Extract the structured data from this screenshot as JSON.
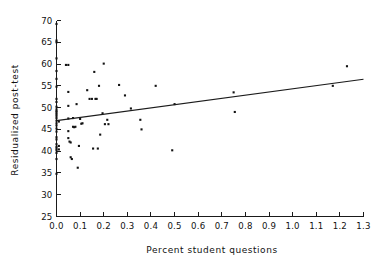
{
  "chart_data": {
    "type": "scatter",
    "title": "",
    "xlabel": "Percent student questions",
    "ylabel": "Residualized post-test",
    "xlim": [
      0.0,
      1.3
    ],
    "ylim": [
      25,
      70
    ],
    "grid": false,
    "legend": false,
    "xticks": [
      "0.0",
      "0.1",
      "0.2",
      "0.3",
      "0.4",
      "0.5",
      "0.6",
      "0.7",
      "0.8",
      "0.9",
      "1.0",
      "1.1",
      "1.2",
      "1.3"
    ],
    "xtick_values": [
      0.0,
      0.1,
      0.2,
      0.3,
      0.4,
      0.5,
      0.6,
      0.7,
      0.8,
      0.9,
      1.0,
      1.1,
      1.2,
      1.3
    ],
    "yticks": [
      "25",
      "30",
      "35",
      "40",
      "45",
      "50",
      "55",
      "60",
      "65",
      "70"
    ],
    "ytick_values": [
      25,
      30,
      35,
      40,
      45,
      50,
      55,
      60,
      65,
      70
    ],
    "marker": "square",
    "marker_color": "#131313",
    "marker_size": 2.1,
    "points": [
      [
        0.0,
        69.2
      ],
      [
        0.0,
        65.4
      ],
      [
        0.0,
        65.0
      ],
      [
        0.0,
        61.3
      ],
      [
        0.0,
        58.4
      ],
      [
        0.0,
        56.6
      ],
      [
        0.0,
        54.8
      ],
      [
        0.0,
        52.0
      ],
      [
        0.0,
        51.3
      ],
      [
        0.0,
        50.2
      ],
      [
        0.0,
        49.6
      ],
      [
        0.0,
        49.2
      ],
      [
        0.0,
        48.9
      ],
      [
        0.0,
        48.5
      ],
      [
        0.0,
        48.1
      ],
      [
        0.0,
        47.6
      ],
      [
        0.0,
        47.0
      ],
      [
        0.0,
        46.4
      ],
      [
        0.0,
        45.9
      ],
      [
        0.0,
        45.2
      ],
      [
        0.0,
        44.5
      ],
      [
        0.0,
        43.2
      ],
      [
        0.0,
        42.7
      ],
      [
        0.0,
        41.6
      ],
      [
        0.0,
        41.0
      ],
      [
        0.0,
        40.6
      ],
      [
        0.0,
        40.2
      ],
      [
        0.0,
        39.6
      ],
      [
        0.0,
        38.2
      ],
      [
        0.0,
        34.8
      ],
      [
        0.01,
        46.8
      ],
      [
        0.01,
        41.2
      ],
      [
        0.01,
        40.4
      ],
      [
        0.04,
        59.8
      ],
      [
        0.05,
        59.8
      ],
      [
        0.05,
        53.6
      ],
      [
        0.05,
        50.4
      ],
      [
        0.05,
        47.5
      ],
      [
        0.05,
        44.6
      ],
      [
        0.05,
        43.0
      ],
      [
        0.055,
        42.2
      ],
      [
        0.06,
        42.0
      ],
      [
        0.06,
        38.6
      ],
      [
        0.065,
        38.2
      ],
      [
        0.07,
        47.6
      ],
      [
        0.07,
        45.6
      ],
      [
        0.075,
        45.5
      ],
      [
        0.08,
        45.6
      ],
      [
        0.085,
        50.8
      ],
      [
        0.09,
        36.2
      ],
      [
        0.095,
        41.2
      ],
      [
        0.1,
        47.4
      ],
      [
        0.105,
        46.3
      ],
      [
        0.11,
        46.4
      ],
      [
        0.13,
        54.0
      ],
      [
        0.14,
        52.0
      ],
      [
        0.15,
        52.0
      ],
      [
        0.155,
        40.6
      ],
      [
        0.16,
        58.2
      ],
      [
        0.165,
        52.0
      ],
      [
        0.17,
        52.0
      ],
      [
        0.175,
        40.6
      ],
      [
        0.18,
        55.0
      ],
      [
        0.185,
        43.8
      ],
      [
        0.195,
        48.7
      ],
      [
        0.2,
        60.1
      ],
      [
        0.205,
        46.2
      ],
      [
        0.215,
        47.2
      ],
      [
        0.22,
        46.2
      ],
      [
        0.265,
        55.2
      ],
      [
        0.29,
        52.8
      ],
      [
        0.315,
        49.8
      ],
      [
        0.355,
        47.2
      ],
      [
        0.36,
        45.0
      ],
      [
        0.42,
        55.0
      ],
      [
        0.49,
        40.2
      ],
      [
        0.5,
        50.8
      ],
      [
        0.75,
        53.5
      ],
      [
        0.755,
        49.0
      ],
      [
        1.17,
        55.0
      ],
      [
        1.23,
        59.5
      ]
    ],
    "fit_line": {
      "label": "regression line",
      "x": [
        0.0,
        1.3
      ],
      "y": [
        47.0,
        56.5
      ]
    }
  }
}
